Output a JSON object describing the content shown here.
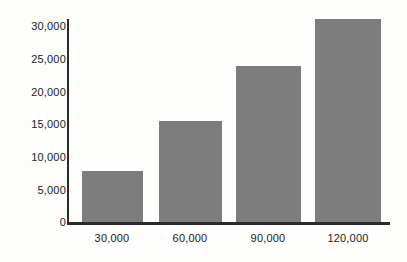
{
  "chart_data": {
    "type": "bar",
    "title": "",
    "subtitle": "",
    "xlabel": "",
    "ylabel": "",
    "categories": [
      "30,000",
      "60,000",
      "90,000",
      "120,000"
    ],
    "values": [
      7500,
      15000,
      23000,
      30000
    ],
    "ylim": [
      0,
      30000
    ],
    "ytick_labels": [
      "30,000",
      "25,000",
      "20,000",
      "15,000",
      "10,000",
      "5,000",
      "0"
    ],
    "ytick_values": [
      30000,
      25000,
      20000,
      15000,
      10000,
      5000,
      0
    ],
    "grid": false,
    "legend": "none",
    "bar_color": "#7d7d7d",
    "axis_color": "#2b2b2b",
    "background_color": "#fdfdfc"
  }
}
